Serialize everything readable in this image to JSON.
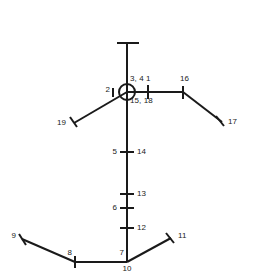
{
  "diagram": {
    "title": "",
    "type": "stick-figure-landmark-diagram",
    "colors": {
      "stroke": "#1a1a1a",
      "background": "#ffffff",
      "text": "#1a1a1a"
    },
    "joint_marker": {
      "name": "head-circle",
      "cx": 127,
      "cy": 92,
      "r": 8
    },
    "segments": [
      {
        "name": "head-top-stem",
        "x1": 127,
        "y1": 43,
        "x2": 127,
        "y2": 92
      },
      {
        "name": "head-top-cap",
        "x1": 117,
        "y1": 43,
        "x2": 139,
        "y2": 43
      },
      {
        "name": "spine",
        "x1": 127,
        "y1": 92,
        "x2": 127,
        "y2": 262
      },
      {
        "name": "right-upper-arm",
        "x1": 127,
        "y1": 92,
        "x2": 183,
        "y2": 92
      },
      {
        "name": "right-forearm",
        "x1": 183,
        "y1": 92,
        "x2": 222,
        "y2": 122
      },
      {
        "name": "right-hand-tick",
        "x1": 216,
        "y1": 116,
        "x2": 224,
        "y2": 126
      },
      {
        "name": "left-arm",
        "x1": 127,
        "y1": 92,
        "x2": 74,
        "y2": 123
      },
      {
        "name": "left-hand-tick",
        "x1": 70,
        "y1": 117,
        "x2": 77,
        "y2": 127
      },
      {
        "name": "left-shoulder-tick",
        "x1": 113,
        "y1": 88,
        "x2": 113,
        "y2": 97
      },
      {
        "name": "right-shoulder-tick",
        "x1": 148,
        "y1": 85,
        "x2": 148,
        "y2": 99
      },
      {
        "name": "right-elbow-tick",
        "x1": 183,
        "y1": 86,
        "x2": 183,
        "y2": 99
      },
      {
        "name": "spine-tick-14",
        "x1": 120,
        "y1": 152,
        "x2": 134,
        "y2": 152
      },
      {
        "name": "spine-tick-13",
        "x1": 120,
        "y1": 194,
        "x2": 134,
        "y2": 194
      },
      {
        "name": "spine-tick-6",
        "x1": 120,
        "y1": 208,
        "x2": 134,
        "y2": 208
      },
      {
        "name": "spine-tick-12",
        "x1": 120,
        "y1": 228,
        "x2": 134,
        "y2": 228
      },
      {
        "name": "left-thigh",
        "x1": 127,
        "y1": 262,
        "x2": 75,
        "y2": 262
      },
      {
        "name": "left-shin",
        "x1": 75,
        "y1": 262,
        "x2": 22,
        "y2": 239
      },
      {
        "name": "left-foot-tick",
        "x1": 19,
        "y1": 234,
        "x2": 26,
        "y2": 245
      },
      {
        "name": "left-knee-tick",
        "x1": 75,
        "y1": 256,
        "x2": 75,
        "y2": 268
      },
      {
        "name": "right-leg",
        "x1": 127,
        "y1": 262,
        "x2": 171,
        "y2": 238
      },
      {
        "name": "right-foot-tick",
        "x1": 166,
        "y1": 233,
        "x2": 174,
        "y2": 243
      }
    ],
    "labels": [
      {
        "name": "label-3-4",
        "text": "3, 4",
        "x": 130,
        "y": 74,
        "align": "start"
      },
      {
        "name": "label-1",
        "text": "1",
        "x": 146,
        "y": 74,
        "align": "start"
      },
      {
        "name": "label-2",
        "text": "2",
        "x": 110,
        "y": 85,
        "align": "end"
      },
      {
        "name": "label-15-18",
        "text": "15, 18",
        "x": 130,
        "y": 96,
        "align": "start"
      },
      {
        "name": "label-16",
        "text": "16",
        "x": 180,
        "y": 74,
        "align": "start"
      },
      {
        "name": "label-17",
        "text": "17",
        "x": 228,
        "y": 117,
        "align": "start"
      },
      {
        "name": "label-19",
        "text": "19",
        "x": 66,
        "y": 118,
        "align": "end"
      },
      {
        "name": "label-5",
        "text": "5",
        "x": 117,
        "y": 147,
        "align": "end"
      },
      {
        "name": "label-14",
        "text": "14",
        "x": 137,
        "y": 147,
        "align": "start"
      },
      {
        "name": "label-13",
        "text": "13",
        "x": 137,
        "y": 189,
        "align": "start"
      },
      {
        "name": "label-6",
        "text": "6",
        "x": 117,
        "y": 203,
        "align": "end"
      },
      {
        "name": "label-12",
        "text": "12",
        "x": 137,
        "y": 223,
        "align": "start"
      },
      {
        "name": "label-9",
        "text": "9",
        "x": 16,
        "y": 231,
        "align": "end"
      },
      {
        "name": "label-8",
        "text": "8",
        "x": 72,
        "y": 248,
        "align": "end"
      },
      {
        "name": "label-7",
        "text": "7",
        "x": 124,
        "y": 248,
        "align": "end"
      },
      {
        "name": "label-10",
        "text": "10",
        "x": 127,
        "y": 264,
        "align": "mid"
      },
      {
        "name": "label-11",
        "text": "11",
        "x": 178,
        "y": 231,
        "align": "start"
      }
    ]
  }
}
